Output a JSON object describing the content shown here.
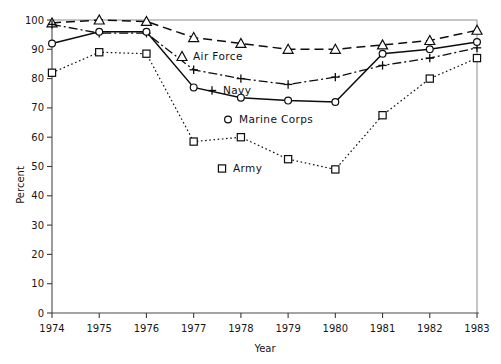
{
  "chart_data": {
    "type": "line",
    "title": "",
    "xlabel": "Year",
    "ylabel": "Percent",
    "x": [
      1974,
      1975,
      1976,
      1977,
      1978,
      1979,
      1980,
      1981,
      1982,
      1983
    ],
    "xtick_labels": [
      "1974",
      "1975",
      "1976",
      "1977",
      "1978",
      "1979",
      "1980",
      "1981",
      "1982",
      "1983"
    ],
    "ytick_labels": [
      "0",
      "10",
      "20",
      "30",
      "40",
      "50",
      "60",
      "70",
      "80",
      "90",
      "100"
    ],
    "ytick_values": [
      0,
      10,
      20,
      30,
      40,
      50,
      60,
      70,
      80,
      90,
      100
    ],
    "ylim": [
      0,
      100
    ],
    "xlim": [
      1974,
      1983
    ],
    "grid": false,
    "legend_position": "inside-center-left",
    "series": [
      {
        "name": "Air Force",
        "marker": "triangle",
        "marker_glyph": "△",
        "linestyle": "dashed",
        "color": "#0d0d0d",
        "values": [
          99,
          100,
          99.5,
          94,
          92,
          90,
          90,
          91.5,
          93,
          96.5
        ]
      },
      {
        "name": "Navy",
        "marker": "plus",
        "marker_glyph": "+",
        "linestyle": "dashdot",
        "color": "#0d0d0d",
        "values": [
          98.5,
          95.5,
          95.5,
          83,
          80,
          78,
          80.5,
          84.5,
          87,
          90.5
        ]
      },
      {
        "name": "Marine Corps",
        "marker": "circle",
        "marker_glyph": "○",
        "linestyle": "solid",
        "color": "#0d0d0d",
        "values": [
          92,
          96,
          96,
          77,
          73.5,
          72.5,
          72,
          88.5,
          90,
          92.5
        ]
      },
      {
        "name": "Army",
        "marker": "square",
        "marker_glyph": "□",
        "linestyle": "dotted",
        "color": "#0d0d0d",
        "values": [
          82,
          89,
          88.5,
          58.5,
          60,
          52.5,
          49,
          67.5,
          80,
          87
        ]
      }
    ],
    "legend": [
      {
        "glyph": "△",
        "label": "Air Force"
      },
      {
        "glyph": "+",
        "label": "Navy"
      },
      {
        "glyph": "○",
        "label": "Marine Corps"
      },
      {
        "glyph": "□",
        "label": "Army"
      }
    ]
  }
}
